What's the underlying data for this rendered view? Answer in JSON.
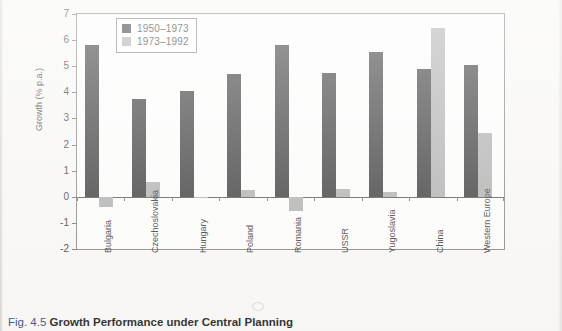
{
  "caption": {
    "number": "Fig. 4.5",
    "title": "Growth Performance under Central Planning"
  },
  "chart_data": {
    "type": "bar",
    "title": "",
    "xlabel": "",
    "ylabel": "Growth (% p.a.)",
    "ylim": [
      -2,
      7
    ],
    "yticks": [
      -2,
      -1,
      0,
      1,
      2,
      3,
      4,
      5,
      6,
      7
    ],
    "ytick_labels": [
      "-2",
      "-1",
      "0",
      "1",
      "2",
      "3",
      "4",
      "5",
      "6",
      "7"
    ],
    "grid": false,
    "legend_position": "top-left",
    "categories": [
      "Bulgaria",
      "Czechoslovakia",
      "Hungary",
      "Poland",
      "Romania",
      "USSR",
      "Yugoslavia",
      "China",
      "Western Europe"
    ],
    "series": [
      {
        "name": "1950–1973",
        "color": "#2b2b2b",
        "values": [
          5.8,
          3.75,
          4.05,
          4.7,
          5.8,
          4.75,
          5.55,
          4.9,
          5.05
        ]
      },
      {
        "name": "1973–1992",
        "color": "#a9a9a9",
        "values": [
          -0.4,
          0.55,
          -0.05,
          0.25,
          -0.55,
          0.3,
          0.2,
          6.45,
          2.45
        ]
      }
    ]
  }
}
